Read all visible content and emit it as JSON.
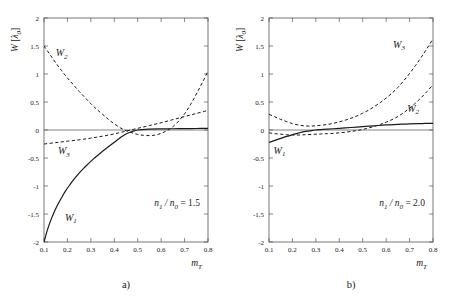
{
  "figure": {
    "panel_captions": [
      "a)",
      "b)"
    ]
  },
  "chart_data": [
    {
      "type": "line",
      "panel": "a",
      "caption": "a)",
      "title": "",
      "xlabel": "m_T",
      "xlabel_main": "m",
      "xlabel_sub": "T",
      "ylabel": "W [λ0]",
      "ylabel_main": "W",
      "ylabel_unit_open": "[",
      "ylabel_unit_main": "λ",
      "ylabel_unit_sub": "0",
      "ylabel_unit_close": "]",
      "xlim": [
        0.1,
        0.8
      ],
      "ylim": [
        -2,
        2
      ],
      "xticks": [
        0.1,
        0.2,
        0.3,
        0.4,
        0.5,
        0.6,
        0.7,
        0.8
      ],
      "xticklabels": [
        "0.1",
        "0.2",
        "0.3",
        "0.4",
        "0.5",
        "0.6",
        "0.7",
        "0.8"
      ],
      "yticks": [
        -2,
        -1.5,
        -1,
        -0.5,
        0,
        0.5,
        1,
        1.5,
        2
      ],
      "yticklabels": [
        "-2",
        "-1.5",
        "-1",
        "-0.5",
        "0",
        "0.5",
        "1",
        "1.5",
        "2"
      ],
      "grid": false,
      "legend": "inline-curve-labels",
      "annotation": "n1/n0 = 1.5",
      "annotation_parts": {
        "n_main": "n",
        "n_sub": "1",
        "slash": "/",
        "d_main": "n",
        "d_sub": "0",
        "equals": "= 1.5"
      },
      "zero_line": 0,
      "series": [
        {
          "name": "W1",
          "label_main": "W",
          "label_sub": "1",
          "style": "solid",
          "label_x": 0.215,
          "label_y": -1.62,
          "x": [
            0.1,
            0.115,
            0.13,
            0.145,
            0.16,
            0.175,
            0.19,
            0.21,
            0.23,
            0.25,
            0.27,
            0.29,
            0.31,
            0.33,
            0.35,
            0.375,
            0.4,
            0.425,
            0.45,
            0.475,
            0.5,
            0.55,
            0.6,
            0.65,
            0.7,
            0.75,
            0.8
          ],
          "y": [
            -2.0,
            -1.78,
            -1.6,
            -1.45,
            -1.32,
            -1.21,
            -1.1,
            -0.98,
            -0.87,
            -0.77,
            -0.68,
            -0.6,
            -0.52,
            -0.45,
            -0.38,
            -0.3,
            -0.22,
            -0.14,
            -0.07,
            -0.03,
            0.0,
            0.015,
            0.02,
            0.022,
            0.025,
            0.027,
            0.03
          ]
        },
        {
          "name": "W2",
          "label_main": "W",
          "label_sub": "2",
          "style": "dashed",
          "label_x": 0.175,
          "label_y": 1.32,
          "x": [
            0.1,
            0.125,
            0.15,
            0.175,
            0.2,
            0.225,
            0.25,
            0.275,
            0.3,
            0.325,
            0.35,
            0.375,
            0.4,
            0.425,
            0.45,
            0.475,
            0.5,
            0.525,
            0.55,
            0.575,
            0.6,
            0.625,
            0.65,
            0.675,
            0.7,
            0.725,
            0.75,
            0.775,
            0.8
          ],
          "y": [
            1.5,
            1.35,
            1.2,
            1.06,
            0.93,
            0.81,
            0.69,
            0.58,
            0.47,
            0.37,
            0.28,
            0.19,
            0.11,
            0.04,
            -0.01,
            -0.05,
            -0.08,
            -0.095,
            -0.1,
            -0.09,
            -0.06,
            -0.01,
            0.06,
            0.16,
            0.29,
            0.45,
            0.64,
            0.84,
            1.05
          ]
        },
        {
          "name": "W3",
          "label_main": "W",
          "label_sub": "3",
          "style": "dashed",
          "label_x": 0.185,
          "label_y": -0.43,
          "x": [
            0.1,
            0.15,
            0.2,
            0.25,
            0.3,
            0.35,
            0.4,
            0.45,
            0.5,
            0.55,
            0.6,
            0.65,
            0.7,
            0.75,
            0.8
          ],
          "y": [
            -0.25,
            -0.225,
            -0.2,
            -0.175,
            -0.145,
            -0.11,
            -0.07,
            -0.02,
            0.03,
            0.08,
            0.13,
            0.185,
            0.24,
            0.295,
            0.35
          ]
        }
      ]
    },
    {
      "type": "line",
      "panel": "b",
      "caption": "b)",
      "title": "",
      "xlabel": "m_T",
      "xlabel_main": "m",
      "xlabel_sub": "T",
      "ylabel": "W [λ0]",
      "ylabel_main": "W",
      "ylabel_unit_open": "[",
      "ylabel_unit_main": "λ",
      "ylabel_unit_sub": "0",
      "ylabel_unit_close": "]",
      "xlim": [
        0.1,
        0.8
      ],
      "ylim": [
        -2,
        2
      ],
      "xticks": [
        0.1,
        0.2,
        0.3,
        0.4,
        0.5,
        0.6,
        0.7,
        0.8
      ],
      "xticklabels": [
        "0.1",
        "0.2",
        "0.3",
        "0.4",
        "0.5",
        "0.6",
        "0.7",
        "0.8"
      ],
      "yticks": [
        -2,
        -1.5,
        -1,
        -0.5,
        0,
        0.5,
        1,
        1.5,
        2
      ],
      "yticklabels": [
        "-2",
        "-1.5",
        "-1",
        "-0.5",
        "0",
        "0.5",
        "1",
        "1.5",
        "2"
      ],
      "grid": false,
      "legend": "inline-curve-labels",
      "annotation": "n1/n0 = 2.0",
      "annotation_parts": {
        "n_main": "n",
        "n_sub": "1",
        "slash": "/",
        "d_main": "n",
        "d_sub": "0",
        "equals": "= 2.0"
      },
      "zero_line": 0,
      "series": [
        {
          "name": "W1",
          "label_main": "W",
          "label_sub": "1",
          "style": "solid",
          "label_x": 0.145,
          "label_y": -0.42,
          "x": [
            0.1,
            0.125,
            0.15,
            0.175,
            0.2,
            0.225,
            0.25,
            0.275,
            0.3,
            0.35,
            0.4,
            0.45,
            0.5,
            0.55,
            0.6,
            0.65,
            0.7,
            0.75,
            0.8
          ],
          "y": [
            -0.22,
            -0.185,
            -0.15,
            -0.115,
            -0.085,
            -0.055,
            -0.03,
            -0.015,
            0.0,
            0.015,
            0.03,
            0.045,
            0.06,
            0.075,
            0.09,
            0.1,
            0.11,
            0.115,
            0.12
          ]
        },
        {
          "name": "W2",
          "label_main": "W",
          "label_sub": "2",
          "style": "dashed",
          "label_x": 0.715,
          "label_y": 0.33,
          "x": [
            0.1,
            0.125,
            0.15,
            0.175,
            0.2,
            0.225,
            0.25,
            0.275,
            0.3,
            0.325,
            0.35,
            0.375,
            0.4,
            0.425,
            0.45,
            0.475,
            0.5,
            0.525,
            0.55,
            0.575,
            0.6,
            0.625,
            0.65,
            0.675,
            0.7,
            0.725,
            0.75,
            0.775,
            0.8
          ],
          "y": [
            -0.05,
            -0.065,
            -0.075,
            -0.085,
            -0.09,
            -0.09,
            -0.085,
            -0.08,
            -0.075,
            -0.07,
            -0.065,
            -0.06,
            -0.05,
            -0.04,
            -0.025,
            -0.01,
            0.01,
            0.035,
            0.065,
            0.1,
            0.14,
            0.185,
            0.24,
            0.31,
            0.39,
            0.48,
            0.58,
            0.69,
            0.81
          ]
        },
        {
          "name": "W3",
          "label_main": "W",
          "label_sub": "3",
          "style": "dashed",
          "label_x": 0.655,
          "label_y": 1.47,
          "x": [
            0.1,
            0.125,
            0.15,
            0.175,
            0.2,
            0.225,
            0.25,
            0.275,
            0.3,
            0.325,
            0.35,
            0.375,
            0.4,
            0.425,
            0.45,
            0.475,
            0.5,
            0.525,
            0.55,
            0.575,
            0.6,
            0.625,
            0.65,
            0.675,
            0.7,
            0.725,
            0.75,
            0.775,
            0.8
          ],
          "y": [
            0.28,
            0.235,
            0.19,
            0.15,
            0.115,
            0.09,
            0.075,
            0.07,
            0.075,
            0.085,
            0.1,
            0.12,
            0.145,
            0.175,
            0.21,
            0.25,
            0.3,
            0.355,
            0.42,
            0.49,
            0.57,
            0.66,
            0.76,
            0.88,
            1.01,
            1.15,
            1.3,
            1.46,
            1.63
          ]
        }
      ]
    }
  ]
}
